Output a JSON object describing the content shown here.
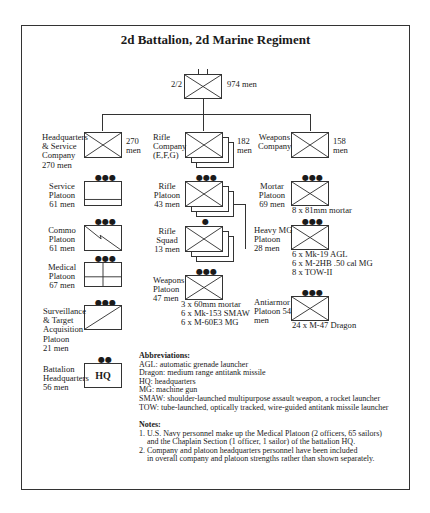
{
  "title": "2d Battalion, 2d Marine Regiment",
  "battalion": {
    "designation": "2/2",
    "strength": "974 men"
  },
  "hq_company": {
    "label": [
      "Headquarters",
      "& Service",
      "Company",
      "270 men"
    ],
    "strength": [
      "270",
      "men"
    ]
  },
  "rifle_company": {
    "label": [
      "Rifle",
      "Company",
      "(E,F,G)"
    ],
    "strength": [
      "182",
      "men"
    ]
  },
  "weapons_company": {
    "label": [
      "Weapons",
      "Company"
    ],
    "strength": [
      "158",
      "men"
    ]
  },
  "hq_units": [
    {
      "label": [
        "Service",
        "Platoon",
        "61 men"
      ],
      "symbol": "service",
      "echelon": "●●●"
    },
    {
      "label": [
        "Commo",
        "Platoon",
        "61 men"
      ],
      "symbol": "signal",
      "echelon": "●●●"
    },
    {
      "label": [
        "Medical",
        "Platoon",
        "67 men"
      ],
      "symbol": "medical",
      "echelon": "●●●"
    },
    {
      "label": [
        "Surveillance",
        "& Target",
        "Acquisition",
        "Platoon",
        "21 men"
      ],
      "symbol": "recon",
      "echelon": "●●●"
    },
    {
      "label": [
        "Battalion",
        "Headquarters",
        "56 men"
      ],
      "symbol": "HQ",
      "echelon": "●●"
    }
  ],
  "rifle_units": [
    {
      "label": [
        "Rifle",
        "Platoon",
        "43 men"
      ],
      "echelon": "●●●"
    },
    {
      "label": [
        "Rifle",
        "Squad",
        "13 men"
      ],
      "echelon": "●"
    },
    {
      "label": [
        "Weapons",
        "Platoon",
        "47 men"
      ],
      "echelon": "●●●",
      "equipment": [
        "3 x 60mm mortar",
        "6 x Mk-153 SMAW",
        "6 x M-60E3 MG"
      ]
    }
  ],
  "weapons_units": [
    {
      "label": [
        "Mortar",
        "Platoon",
        "69 men"
      ],
      "echelon": "●●●",
      "equipment": [
        "8 x 81mm mortar"
      ]
    },
    {
      "label": [
        "Heavy MG",
        "Platoon",
        "28 men"
      ],
      "echelon": "●●●",
      "equipment": [
        "6 x Mk-19 AGL",
        "6 x M-2HB .50 cal MG",
        "8 x TOW-II"
      ]
    },
    {
      "label": [
        "Antiarmor",
        "Platoon  54",
        "men"
      ],
      "echelon": "●●●",
      "equipment": [
        "24 x M-47 Dragon"
      ]
    }
  ],
  "abbreviations": {
    "heading": "Abbreviations",
    "items": [
      "AGL: automatic grenade launcher",
      "Dragon: medium range antitank missile",
      "HQ: headquarters",
      "MG: machine gun",
      "SMAW: shoulder-launched multipurpose assault weapon, a rocket launcher",
      "TOW: tube-launched, optically tracked, wire-guided antitank missile launcher"
    ]
  },
  "notes": {
    "heading": "Notes",
    "items": [
      [
        "1. U.S. Navy personnel make up the Medical Platoon (2 officers, 65 sailors)",
        "and the Chaplain Section (1 officer, 1 sailor) of the battalion HQ."
      ],
      [
        "2. Company and platoon headquarters personnel have been included",
        "in overall company and platoon strengths rather than shown separately."
      ]
    ]
  }
}
